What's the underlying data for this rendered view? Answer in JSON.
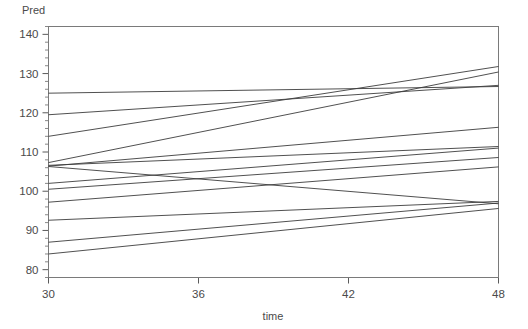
{
  "chart_data": {
    "type": "line",
    "title": "",
    "subtitle": "",
    "xlabel": "time",
    "ylabel": "Pred",
    "xlim": [
      30,
      48
    ],
    "ylim": [
      78,
      142
    ],
    "xticks": [
      30,
      36,
      42,
      48
    ],
    "xtick_labels": [
      "30",
      "36",
      "42",
      "48"
    ],
    "yticks": [
      80,
      90,
      100,
      110,
      120,
      130,
      140
    ],
    "ytick_labels": [
      "80",
      "90",
      "100",
      "110",
      "120",
      "130",
      "140"
    ],
    "y_minor_tick_step": 2,
    "grid": false,
    "legend": "none",
    "line_color": "#3c3c3c",
    "frame_color": "#7a7a7a",
    "background": "#ffffff",
    "x": [
      30,
      48
    ],
    "series": [
      {
        "name": "subject-01",
        "values": [
          125.0,
          126.7
        ]
      },
      {
        "name": "subject-02",
        "values": [
          119.5,
          127.0
        ]
      },
      {
        "name": "subject-03",
        "values": [
          114.0,
          131.8
        ]
      },
      {
        "name": "subject-04",
        "values": [
          107.3,
          130.4
        ]
      },
      {
        "name": "subject-05",
        "values": [
          106.6,
          111.4
        ]
      },
      {
        "name": "subject-06",
        "values": [
          106.4,
          116.3
        ]
      },
      {
        "name": "subject-07",
        "values": [
          106.3,
          96.8
        ]
      },
      {
        "name": "subject-08",
        "values": [
          102.0,
          111.0
        ]
      },
      {
        "name": "subject-09",
        "values": [
          100.5,
          108.6
        ]
      },
      {
        "name": "subject-10",
        "values": [
          97.2,
          106.2
        ]
      },
      {
        "name": "subject-11",
        "values": [
          92.6,
          97.4
        ]
      },
      {
        "name": "subject-12",
        "values": [
          87.0,
          97.0
        ]
      },
      {
        "name": "subject-13",
        "values": [
          84.0,
          95.6
        ]
      }
    ]
  },
  "axis": {
    "y_title": "Pred",
    "x_title": "time"
  }
}
